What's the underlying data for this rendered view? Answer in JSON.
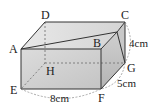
{
  "figure": {
    "type": "rectangular prism with cutting plane",
    "vertices": {
      "A": "A",
      "B": "B",
      "C": "C",
      "D": "D",
      "E": "E",
      "F": "F",
      "G": "G",
      "H": "H"
    },
    "dimensions": {
      "height": "4cm",
      "depth": "5cm",
      "width": "8cm"
    },
    "colors": {
      "edge": "#333333",
      "front_face": "#d0d0d0",
      "top_face": "#e2e2e2",
      "right_face": "#bdbdbd",
      "dashed": "#777777"
    }
  }
}
